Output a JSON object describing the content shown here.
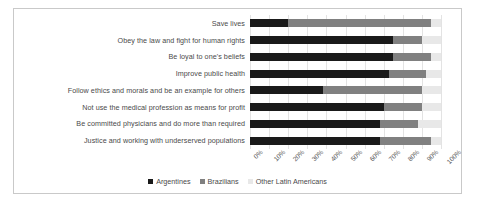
{
  "chart_data": {
    "type": "bar",
    "subtype": "stacked-horizontal-100-percent",
    "title": "",
    "xlabel": "",
    "ylabel": "",
    "xlim": [
      0,
      100
    ],
    "grid": true,
    "legend_position": "bottom",
    "orientation": "horizontal",
    "categories": [
      "Save lives",
      "Obey the law and fight for human rights",
      "Be loyal to one's beliefs",
      "Improve public health",
      "Follow ethics and morals and be an example for others",
      "Not use the medical profession as means for profit",
      "Be committed physicians and do more than required",
      "Justice and working with underserved populations"
    ],
    "tick_labels": [
      "0%",
      "10%",
      "20%",
      "30%",
      "40%",
      "50%",
      "60%",
      "70%",
      "80%",
      "90%",
      "100%"
    ],
    "tick_values": [
      0,
      10,
      20,
      30,
      40,
      50,
      60,
      70,
      80,
      90,
      100
    ],
    "series": [
      {
        "name": "Argentines",
        "color": "#1a1a1a",
        "values": [
          20,
          75,
          75,
          73,
          38,
          70,
          68,
          68
        ]
      },
      {
        "name": "Brazilians",
        "color": "#808080",
        "values": [
          75,
          15,
          20,
          19,
          52,
          20,
          20,
          27
        ]
      },
      {
        "name": "Other Latin Americans",
        "color": "#e8e8e8",
        "values": [
          5,
          10,
          5,
          8,
          10,
          10,
          12,
          5
        ]
      }
    ]
  }
}
